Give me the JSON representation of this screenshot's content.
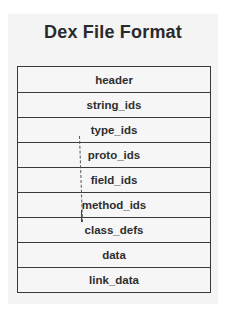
{
  "title": "Dex File Format",
  "sections": [
    {
      "label": "header"
    },
    {
      "label": "string_ids"
    },
    {
      "label": "type_ids"
    },
    {
      "label": "proto_ids"
    },
    {
      "label": "field_ids"
    },
    {
      "label": "method_ids"
    },
    {
      "label": "class_defs"
    },
    {
      "label": "data"
    },
    {
      "label": "link_data"
    }
  ]
}
